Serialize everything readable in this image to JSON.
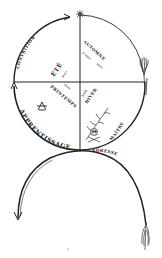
{
  "diagram": {
    "type": "cyclical-seasons-diagram",
    "colors": {
      "ink": "#222222",
      "background": "#ffffff"
    },
    "labels": {
      "arc_top_left": "CONTRITION",
      "arc_bottom": "APPRENTISSAGE",
      "arc_lower_right": "ADRESSE",
      "ete": "ÉTÉ",
      "ete_sub": "mois",
      "automne": "AUTOMNE",
      "automne_sub": "3 mois",
      "automne_sub2": "mois",
      "printemps": "PRINTEMPS",
      "printemps_sub": "mois",
      "hiver": "HIVER",
      "hiver_sub": "SAIS",
      "maitre": "MAÎTRE"
    },
    "icons": {
      "top": "star-icon",
      "left_quadrant": "compass-square-icon",
      "right_end": "wheat-sheaf-icon",
      "lower_right": "skull-crossbones-branch-icon",
      "bottom_right": "feather-icon",
      "bottom_left_arrow": "arrow-down-icon"
    }
  }
}
